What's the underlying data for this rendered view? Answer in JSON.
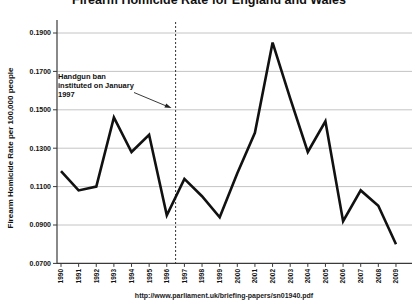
{
  "page": {
    "source_url": "http://www.parliament.uk/briefing-papers/sn01940.pdf"
  },
  "chart_data": {
    "type": "line",
    "title": "Firearm Homicide Rate for England and Wales",
    "xlabel": "",
    "ylabel": "Firearm Homicide Rate per 100,000 people",
    "x": [
      1990,
      1991,
      1992,
      1993,
      1994,
      1995,
      1996,
      1997,
      1998,
      1999,
      2000,
      2001,
      2002,
      2003,
      2004,
      2005,
      2006,
      2007,
      2008,
      2009
    ],
    "series": [
      {
        "name": "Firearm homicide rate",
        "values": [
          0.118,
          0.108,
          0.11,
          0.146,
          0.128,
          0.137,
          0.095,
          0.114,
          0.105,
          0.094,
          0.117,
          0.138,
          0.185,
          0.156,
          0.128,
          0.144,
          0.092,
          0.108,
          0.1,
          0.08
        ]
      }
    ],
    "ylim": [
      0.07,
      0.19
    ],
    "ytick_step": 0.02,
    "ytick_labels": [
      "0.1900",
      "0.1700",
      "0.1500",
      "0.1300",
      "0.1100",
      "0.0900",
      "0.0700"
    ],
    "grid": true,
    "legend": "none",
    "line_color": "#111111",
    "grid_color": "#b5b5b5",
    "axis_color": "#3a3a3a",
    "annotation": {
      "lines": [
        "Handgun ban",
        "instituted on January",
        "1997"
      ],
      "target_year": 1996.5,
      "dashed_line_style": "dotted-vertical"
    }
  }
}
